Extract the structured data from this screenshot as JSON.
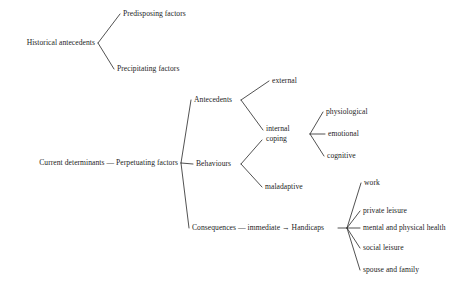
{
  "diagram": {
    "type": "tree",
    "orientation": "left-to-right",
    "title": "",
    "background_color": "#ffffff",
    "line_color": "#333333",
    "text_color": "#242424",
    "nodes": [
      {
        "id": "historical_antecedents",
        "label": "Historical antecedents",
        "x": 95,
        "y": 43,
        "anchor": "right",
        "depth": 0
      },
      {
        "id": "predisposing_factors",
        "label": "Predisposing factors",
        "x": 123,
        "y": 14,
        "anchor": "left",
        "depth": 1
      },
      {
        "id": "precipitating_factors",
        "label": "Precipitating factors",
        "x": 117,
        "y": 69,
        "anchor": "left",
        "depth": 1
      },
      {
        "id": "current_determinants",
        "label": "Current determinants — Perpetuating factors",
        "x": 178,
        "y": 163,
        "anchor": "right",
        "depth": 0
      },
      {
        "id": "antecedents",
        "label": "Antecedents",
        "x": 194,
        "y": 100,
        "anchor": "left",
        "depth": 1
      },
      {
        "id": "behaviours",
        "label": "Behaviours",
        "x": 196,
        "y": 164,
        "anchor": "left",
        "depth": 1
      },
      {
        "id": "consequences",
        "label": "Consequences — immediate → Handicaps",
        "x": 192,
        "y": 228,
        "anchor": "left",
        "depth": 1
      },
      {
        "id": "external",
        "label": "external",
        "x": 272,
        "y": 81,
        "anchor": "left",
        "depth": 2
      },
      {
        "id": "internal_coping",
        "label": "internal\ncoping",
        "x": 266,
        "y": 134,
        "anchor": "left",
        "depth": 2,
        "lines": 2
      },
      {
        "id": "maladaptive",
        "label": "maladaptive",
        "x": 265,
        "y": 187,
        "anchor": "left",
        "depth": 2
      },
      {
        "id": "physiological",
        "label": "physiological",
        "x": 326,
        "y": 112,
        "anchor": "left",
        "depth": 3
      },
      {
        "id": "emotional",
        "label": "emotional",
        "x": 328,
        "y": 134,
        "anchor": "left",
        "depth": 3
      },
      {
        "id": "cognitive",
        "label": "cognitive",
        "x": 327,
        "y": 156,
        "anchor": "left",
        "depth": 3
      },
      {
        "id": "work",
        "label": "work",
        "x": 364,
        "y": 183,
        "anchor": "left",
        "depth": 2
      },
      {
        "id": "private_leisure",
        "label": "private leisure",
        "x": 363,
        "y": 211,
        "anchor": "left",
        "depth": 2
      },
      {
        "id": "mental_physical_health",
        "label": "mental and physical health",
        "x": 363,
        "y": 228,
        "anchor": "left",
        "depth": 2
      },
      {
        "id": "social_leisure",
        "label": "social leisure",
        "x": 363,
        "y": 248,
        "anchor": "left",
        "depth": 2
      },
      {
        "id": "spouse_and_family",
        "label": "spouse and family",
        "x": 363,
        "y": 270,
        "anchor": "left",
        "depth": 2
      }
    ],
    "edges": [
      {
        "from": "historical_antecedents",
        "to": "predisposing_factors",
        "path": "M 98,43 L 120,14"
      },
      {
        "from": "historical_antecedents",
        "to": "precipitating_factors",
        "path": "M 98,43 L 114,69"
      },
      {
        "from": "current_determinants",
        "to": "antecedents",
        "path": "M 181,163 L 191,100"
      },
      {
        "from": "current_determinants",
        "to": "behaviours",
        "path": "M 181,163 L 193,164"
      },
      {
        "from": "current_determinants",
        "to": "consequences",
        "path": "M 181,163 L 189,228"
      },
      {
        "from": "antecedents",
        "to": "external",
        "path": "M 241,100 L 269,81"
      },
      {
        "from": "antecedents",
        "to": "internal_coping",
        "path": "M 241,100 L 263,130"
      },
      {
        "from": "behaviours",
        "to": "cognitive",
        "path": "M 241,164 L 262,140"
      },
      {
        "from": "behaviours",
        "to": "maladaptive",
        "path": "M 241,164 L 262,187"
      },
      {
        "from": "internal_coping",
        "to": "physiological",
        "path": "M 310,134 L 323,112"
      },
      {
        "from": "internal_coping",
        "to": "emotional",
        "path": "M 310,134 L 325,134"
      },
      {
        "from": "internal_coping",
        "to": "cognitive",
        "path": "M 310,134 L 324,156"
      },
      {
        "from": "consequences",
        "to": "work",
        "path": "M 347,228 L 361,183"
      },
      {
        "from": "consequences",
        "to": "private_leisure",
        "path": "M 347,228 L 360,211"
      },
      {
        "from": "consequences",
        "to": "mental_physical_health",
        "path": "M 347,228 L 360,228"
      },
      {
        "from": "consequences",
        "to": "social_leisure",
        "path": "M 347,228 L 360,248"
      },
      {
        "from": "consequences",
        "to": "spouse_and_family",
        "path": "M 347,228 L 360,270"
      },
      {
        "from": "consequences_node",
        "to": "fan_junction",
        "path": "M 338,228 L 347,228"
      }
    ]
  }
}
